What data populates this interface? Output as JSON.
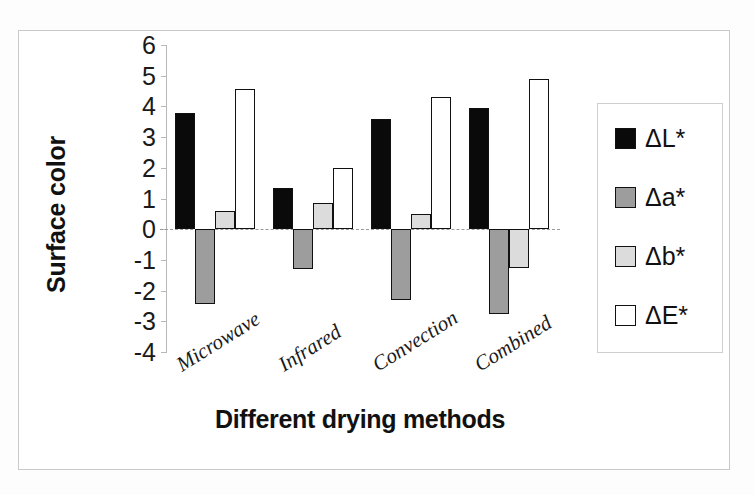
{
  "chart_data": {
    "type": "bar",
    "title": "",
    "subtitle": "",
    "xlabel": "Different drying methods",
    "ylabel": "Surface color",
    "categories": [
      "Microwave",
      "Infrared",
      "Convection",
      "Combined"
    ],
    "series": [
      {
        "name": "ΔL*",
        "color": "#0a0a0a",
        "values": [
          3.8,
          1.35,
          3.6,
          3.95
        ]
      },
      {
        "name": "Δa*",
        "color": "#9d9d9d",
        "values": [
          -2.45,
          -1.3,
          -2.3,
          -2.75
        ]
      },
      {
        "name": "Δb*",
        "color": "#dcdcdc",
        "values": [
          0.6,
          0.85,
          0.5,
          -1.25
        ]
      },
      {
        "name": "ΔE*",
        "color": "#ffffff",
        "values": [
          4.58,
          2.0,
          4.3,
          4.9
        ]
      }
    ],
    "ylim": [
      -4,
      6
    ],
    "ytick_labels": [
      "6",
      "5",
      "4",
      "3",
      "2",
      "1",
      "0",
      "-1",
      "-2",
      "-3",
      "-4"
    ],
    "ytick_values": [
      6,
      5,
      4,
      3,
      2,
      1,
      0,
      -1,
      -2,
      -3,
      -4
    ],
    "grid": false,
    "zero_line": true,
    "legend_position": "right",
    "xtick_rotation": -32
  },
  "legend": {
    "entries": [
      {
        "label": "ΔL*"
      },
      {
        "label": "Δa*"
      },
      {
        "label": "Δb*"
      },
      {
        "label": "ΔE*"
      }
    ]
  },
  "axes": {
    "y_title": "Surface color",
    "x_title": "Different drying methods"
  }
}
